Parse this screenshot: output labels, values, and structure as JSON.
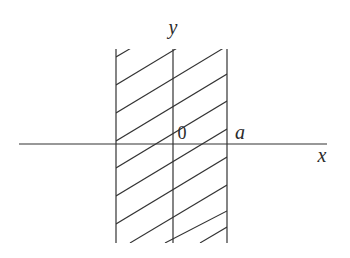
{
  "diagram": {
    "labels": {
      "y_axis": "y",
      "x_axis": "x",
      "origin": "0",
      "a": "a"
    },
    "colors": {
      "stroke": "#333333",
      "background": "#ffffff"
    }
  }
}
